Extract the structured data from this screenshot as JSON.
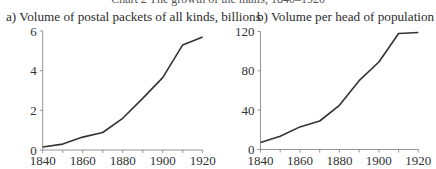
{
  "figure": {
    "clipped_header": "Chart 2 The growth of the mails, 1840–1920"
  },
  "chart_data": [
    {
      "type": "line",
      "title": "a) Volume of postal packets of all kinds, billions",
      "xlabel": "",
      "ylabel": "",
      "x": [
        1840,
        1850,
        1860,
        1870,
        1880,
        1890,
        1900,
        1910,
        1920
      ],
      "series": [
        {
          "name": "Volume of postal packets (billions)",
          "values": [
            0.15,
            0.3,
            0.65,
            0.88,
            1.6,
            2.6,
            3.65,
            5.3,
            5.7
          ]
        }
      ],
      "xticks": [
        1840,
        1860,
        1880,
        1900,
        1920
      ],
      "xminor": [
        1850,
        1870,
        1890,
        1910
      ],
      "yticks": [
        0,
        2,
        4,
        6
      ],
      "xlim": [
        1840,
        1920
      ],
      "ylim": [
        0,
        6
      ],
      "grid": false,
      "legend": "none"
    },
    {
      "type": "line",
      "title": "b) Volume per head of population",
      "xlabel": "",
      "ylabel": "",
      "x": [
        1840,
        1850,
        1860,
        1870,
        1880,
        1890,
        1900,
        1910,
        1920
      ],
      "series": [
        {
          "name": "Volume per head of population",
          "values": [
            7,
            13.5,
            23,
            29,
            45,
            70,
            89,
            118,
            119
          ]
        }
      ],
      "xticks": [
        1840,
        1860,
        1880,
        1900,
        1920
      ],
      "xminor": [
        1850,
        1870,
        1890,
        1910
      ],
      "yticks": [
        0,
        40,
        80,
        120
      ],
      "xlim": [
        1840,
        1920
      ],
      "ylim": [
        0,
        120
      ],
      "grid": false,
      "legend": "none"
    }
  ]
}
